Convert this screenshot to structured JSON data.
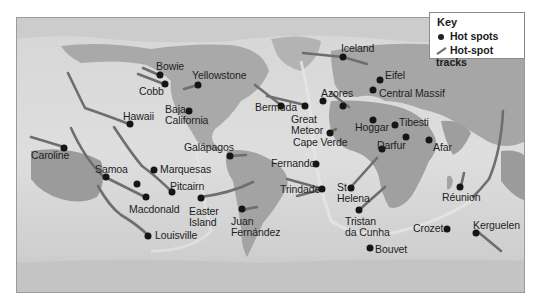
{
  "key": {
    "title": "Key",
    "items": [
      {
        "symbol": "dot",
        "label": "Hot spots"
      },
      {
        "symbol": "track",
        "label": "Hot-spot tracks"
      }
    ]
  },
  "colors": {
    "ocean_deep": "#c9c9c9",
    "ocean_light": "#dcdcdc",
    "land": "#a8a8a8",
    "land_dark": "#8f8f8f",
    "ice": "#c4c4c4",
    "dot": "#151515",
    "track": "#6e6e6e",
    "border": "#9a9a9a"
  },
  "hotspots": [
    {
      "name": "Bowie",
      "label": "Bowie"
    },
    {
      "name": "Cobb",
      "label": "Cobb"
    },
    {
      "name": "Yellowstone",
      "label": "Yellowstone"
    },
    {
      "name": "Baja California",
      "label": "Baja\nCalifornia"
    },
    {
      "name": "Hawaii",
      "label": "Hawaii"
    },
    {
      "name": "Caroline",
      "label": "Caroline"
    },
    {
      "name": "Galápagos",
      "label": "Galápagos"
    },
    {
      "name": "Marquesas",
      "label": "Marquesas"
    },
    {
      "name": "Samoa",
      "label": "Samoa"
    },
    {
      "name": "Pitcairn",
      "label": "Pitcairn"
    },
    {
      "name": "Macdonald",
      "label": "Macdonald"
    },
    {
      "name": "Easter Island",
      "label": "Easter\nIsland"
    },
    {
      "name": "Juan Fernández",
      "label": "Juan\nFernández"
    },
    {
      "name": "Louisville",
      "label": "Louisville"
    },
    {
      "name": "Iceland",
      "label": "Iceland"
    },
    {
      "name": "Bermuda",
      "label": "Bermuda"
    },
    {
      "name": "Great Meteor",
      "label": "Great\nMeteor"
    },
    {
      "name": "Azores",
      "label": "Azores"
    },
    {
      "name": "Eifel",
      "label": "Eifel"
    },
    {
      "name": "Central Massif",
      "label": "Central Massif"
    },
    {
      "name": "Cape Verde",
      "label": "Cape Verde"
    },
    {
      "name": "Hoggar",
      "label": "Hoggar"
    },
    {
      "name": "Tibesti",
      "label": "Tibesti"
    },
    {
      "name": "Darfur",
      "label": "Darfur"
    },
    {
      "name": "Afar",
      "label": "Afar"
    },
    {
      "name": "Fernando",
      "label": "Fernando"
    },
    {
      "name": "Trindade",
      "label": "Trindade"
    },
    {
      "name": "St Helena",
      "label": "St\nHelena"
    },
    {
      "name": "Tristan da Cunha",
      "label": "Tristan\nda Cunha"
    },
    {
      "name": "Réunion",
      "label": "Réunion"
    },
    {
      "name": "Crozet",
      "label": "Crozet"
    },
    {
      "name": "Kerguelen",
      "label": "Kerguelen"
    },
    {
      "name": "Bouvet",
      "label": "Bouvet"
    }
  ]
}
